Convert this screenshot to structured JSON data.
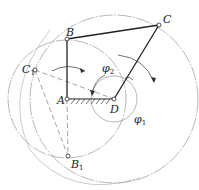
{
  "diagram": {
    "points": {
      "A": {
        "label": "A",
        "x": 67,
        "y": 99
      },
      "B": {
        "label": "B",
        "x": 67,
        "y": 39
      },
      "C": {
        "label": "C",
        "x": 159,
        "y": 25
      },
      "D": {
        "label": "D",
        "x": 114,
        "y": 99
      },
      "C1": {
        "label": "C",
        "sub": "1",
        "x": 35,
        "y": 70
      },
      "B1": {
        "label": "B",
        "sub": "1",
        "x": 68,
        "y": 156
      }
    },
    "angles": {
      "phi2": {
        "label": "φ",
        "sub": "2"
      },
      "phi1": {
        "label": "φ",
        "sub": "1"
      }
    },
    "colors": {
      "link": "#222222",
      "construction": "#777777",
      "ground_hatch": "#333333"
    }
  }
}
